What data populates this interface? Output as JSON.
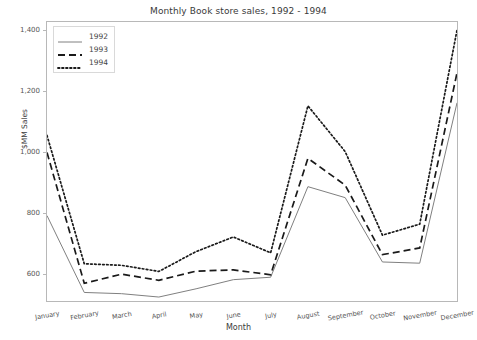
{
  "chart_data": {
    "type": "line",
    "title": "Monthly Book store sales, 1992 - 1994",
    "xlabel": "Month",
    "ylabel": "$MM Sales",
    "categories": [
      "January",
      "February",
      "March",
      "April",
      "May",
      "June",
      "July",
      "August",
      "September",
      "October",
      "November",
      "December"
    ],
    "series": [
      {
        "name": "1992",
        "style": "solid",
        "color": "#808080",
        "values": [
          790,
          538,
          534,
          523,
          550,
          580,
          588,
          885,
          849,
          638,
          634,
          1160
        ]
      },
      {
        "name": "1993",
        "style": "dashed",
        "color": "#1a1a1a",
        "values": [
          997,
          568,
          598,
          578,
          608,
          612,
          596,
          978,
          890,
          662,
          684,
          1258
        ]
      },
      {
        "name": "1994",
        "style": "dotted",
        "color": "#1a1a1a",
        "values": [
          1053,
          632,
          627,
          607,
          672,
          720,
          668,
          1150,
          1000,
          726,
          762,
          1398
        ]
      }
    ],
    "ylim": [
      510,
      1425
    ],
    "yticks": [
      600,
      800,
      1000,
      1200,
      1400
    ],
    "ytick_labels": [
      "600",
      "800",
      "1,000",
      "1,200",
      "1,400"
    ],
    "grid": false,
    "legend_position": "upper left",
    "legend_entries": [
      "1992",
      "1993",
      "1994"
    ]
  }
}
